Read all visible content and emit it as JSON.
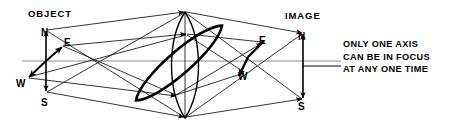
{
  "figure": {
    "title_left": "OBJECT",
    "title_right": "IMAGE",
    "note_lines": [
      "ONLY ONE AXIS",
      "CAN BE  IN FOCUS",
      "AT ANY ONE  TIME"
    ],
    "colors": {
      "ink": "#000000",
      "optical_axis": "#808080",
      "ray": "#1a1a1a",
      "background": "#ffffff"
    },
    "object_cardinals": [
      {
        "label": "N",
        "x": 41,
        "y": 36
      },
      {
        "label": "E",
        "x": 64,
        "y": 46
      },
      {
        "label": "W",
        "x": 16,
        "y": 87
      },
      {
        "label": "S",
        "x": 41,
        "y": 106
      }
    ],
    "image_cardinals": [
      {
        "label": "N",
        "x": 298,
        "y": 40
      },
      {
        "label": "E",
        "x": 259,
        "y": 44
      },
      {
        "label": "W",
        "x": 238,
        "y": 80
      },
      {
        "label": "S",
        "x": 298,
        "y": 110
      }
    ],
    "optical_axis": {
      "x1": 22,
      "y1": 61,
      "x2": 341,
      "y2": 61
    },
    "object_axis": {
      "x": 46,
      "y_top": 30,
      "y_bottom": 92
    },
    "image_axis": {
      "x": 303,
      "y_top": 33,
      "y_bottom": 100
    },
    "lens": {
      "cx": 185,
      "top_y": 12,
      "bottom_y": 118,
      "half_width": 18
    },
    "tilted_lens": {
      "cx": 179,
      "cy": 63,
      "rx": 57,
      "ry": 15,
      "rotation_deg": -41
    }
  }
}
